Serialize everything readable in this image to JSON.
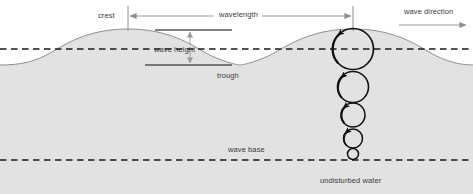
{
  "diagram": {
    "labels": {
      "crest": "crest",
      "wavelength": "wavelength",
      "wave_direction": "wave direction",
      "wave_height": "wave height",
      "trough": "trough",
      "wave_base": "wave base",
      "undisturbed_water": "undisturbed water"
    },
    "colors": {
      "background": "#ffffff",
      "water_fill": "#e2e2e2",
      "water_outline": "#8a8a8a",
      "dashed_line": "#1a1a1a",
      "label_text": "#3a3a3a",
      "arrow_gray": "#8e8e8e",
      "orbit_circle": "#111111"
    },
    "geometry": {
      "width": 473,
      "height": 194,
      "still_water_level_y": 49,
      "crest_y": 29,
      "trough_y": 65,
      "wave_base_y": 160,
      "crest_1_x": 128,
      "crest_2_x": 353,
      "wavelength_px": 225
    },
    "orbital_circles": [
      {
        "cx": 353,
        "cy": 49,
        "r": 20.5,
        "arrow": "counterclockwise"
      },
      {
        "cx": 353,
        "cy": 87,
        "r": 15.5,
        "arrow": "counterclockwise"
      },
      {
        "cx": 353,
        "cy": 115,
        "r": 12,
        "arrow": "counterclockwise"
      },
      {
        "cx": 353,
        "cy": 138.5,
        "r": 9.5,
        "arrow": "counterclockwise"
      },
      {
        "cx": 353,
        "cy": 154,
        "r": 5.5,
        "arrow": "counterclockwise"
      }
    ]
  }
}
